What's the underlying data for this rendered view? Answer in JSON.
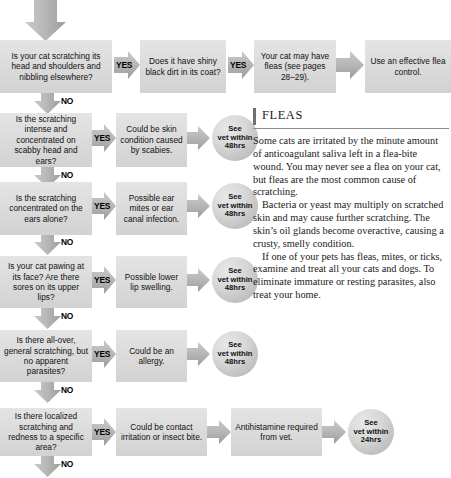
{
  "colors": {
    "box_fill": "#dcdcdc",
    "arrow_fill": "#b4b4b4",
    "circle_fill": "#cfcfcf",
    "text": "#111111",
    "rule": "#8c8c8c"
  },
  "labels": {
    "yes": "YES",
    "no": "NO"
  },
  "entry_arrow": {
    "name": "entry-arrow-down"
  },
  "rows": [
    {
      "id": "row-1",
      "question": "Is your cat scratching its head and shoulders and nibbling elsewhere?",
      "yes_label": "YES",
      "no_label": "NO",
      "steps": [
        "Does it have shiny black dirt in its coat?",
        "Your cat may have fleas (see pages 28–29).",
        "Use an effective flea control."
      ],
      "second_yes_label": "YES",
      "outcome_circle": null
    },
    {
      "id": "row-2",
      "question": "Is the scratching intense and concentrated on scabby head and ears?",
      "yes_label": "YES",
      "no_label": "NO",
      "steps": [
        "Could be skin condition caused by scabies."
      ],
      "outcome_circle": "See vet within 48hrs"
    },
    {
      "id": "row-3",
      "question": "Is the scratching concentrated on the ears alone?",
      "yes_label": "YES",
      "no_label": "NO",
      "steps": [
        "Possible ear mites or ear canal infection."
      ],
      "outcome_circle": "See vet within 48hrs"
    },
    {
      "id": "row-4",
      "question": "Is your cat pawing at its face? Are there sores on its upper lips?",
      "yes_label": "YES",
      "no_label": "NO",
      "steps": [
        "Possible lower lip swelling."
      ],
      "outcome_circle": "See vet within 48hrs"
    },
    {
      "id": "row-5",
      "question": "Is there all-over, general scratching, but no apparent parasites?",
      "yes_label": "YES",
      "no_label": "NO",
      "steps": [
        "Could be an allergy."
      ],
      "outcome_circle": "See vet within 48hrs"
    },
    {
      "id": "row-6",
      "question": "Is there localized scratching and redness to a specific area?",
      "yes_label": "YES",
      "no_label": "NO",
      "steps": [
        "Could be contact irritation or insect bite.",
        "Antihistamine required from vet."
      ],
      "outcome_circle": "See vet within 24hrs"
    }
  ],
  "circle_text": {
    "line1": "See",
    "line2": "vet within",
    "line3_48": "48hrs",
    "line3_24": "24hrs"
  },
  "sidebar": {
    "heading": "FLEAS",
    "paragraphs": [
      "Some cats are irritated by the minute amount of anticoagulant saliva left in a flea-bite wound. You may never see a flea on your cat, but fleas are the most common cause of scratching.",
      "Bacteria or yeast may multiply on scratched skin and may cause further scratching. The skin’s oil glands become overactive, causing a crusty, smelly condition.",
      "If one of your pets has fleas, mites, or ticks, examine and treat all your cats and dogs. To eliminate immature or resting parasites, also treat your home."
    ]
  }
}
